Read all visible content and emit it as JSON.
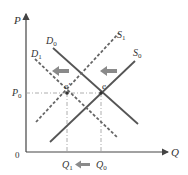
{
  "diagram": {
    "type": "supply-demand",
    "axes": {
      "y_label": "P",
      "x_label": "Q",
      "origin_label": "0"
    },
    "price_levels": [
      {
        "label": "P",
        "sub": "0",
        "y": 93
      }
    ],
    "quantity_levels": [
      {
        "label": "Q",
        "sub": "1",
        "x": 67
      },
      {
        "label": "Q",
        "sub": "0",
        "x": 101
      }
    ],
    "curves": [
      {
        "id": "D0",
        "label": "D",
        "sub": "0",
        "kind": "demand",
        "style": "solid"
      },
      {
        "id": "D1",
        "label": "D",
        "sub": "1",
        "kind": "demand",
        "style": "dashed"
      },
      {
        "id": "S0",
        "label": "S",
        "sub": "0",
        "kind": "supply",
        "style": "solid"
      },
      {
        "id": "S1",
        "label": "S",
        "sub": "1",
        "kind": "supply",
        "style": "dashed"
      }
    ],
    "equilibria": [
      {
        "label": "e",
        "prime": false,
        "x": 101,
        "y": 93
      },
      {
        "label": "e′",
        "prime": true,
        "x": 67,
        "y": 93
      }
    ],
    "shift_arrows": [
      {
        "name": "demand-shift-left",
        "direction": "left"
      },
      {
        "name": "supply-shift-left",
        "direction": "left"
      },
      {
        "name": "quantity-shift-left",
        "direction": "left"
      }
    ],
    "colors": {
      "solid_curve": "#555555",
      "dashed_curve": "#666666",
      "axis": "#444444",
      "arrow": "#8a8a8a",
      "guide": "#999999"
    }
  }
}
